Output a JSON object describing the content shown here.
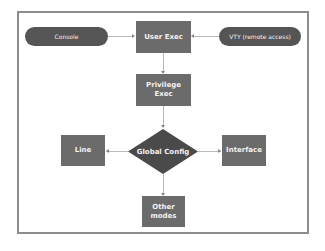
{
  "diagram": {
    "title": "",
    "nodes": {
      "console": {
        "label": "Console",
        "shape": "pill"
      },
      "user_exec": {
        "label": "User Exec",
        "shape": "rectangle"
      },
      "vty": {
        "label": "VTY (remote access)",
        "shape": "pill"
      },
      "privilege_exec": {
        "label": "Privilege Exec",
        "shape": "rectangle"
      },
      "global_config": {
        "label": "Global Config",
        "shape": "diamond"
      },
      "line": {
        "label": "Line",
        "shape": "rectangle"
      },
      "interface": {
        "label": "Interface",
        "shape": "rectangle"
      },
      "other_modes": {
        "label": "Other\nmodes",
        "line1": "Other",
        "line2": "modes",
        "shape": "rectangle"
      }
    },
    "edges": [
      {
        "from": "Console",
        "to": "User Exec"
      },
      {
        "from": "VTY (remote access)",
        "to": "User Exec"
      },
      {
        "from": "User Exec",
        "to": "Privilege Exec"
      },
      {
        "from": "Privilege Exec",
        "to": "Global Config"
      },
      {
        "from": "Global Config",
        "to": "Line"
      },
      {
        "from": "Global Config",
        "to": "Interface"
      },
      {
        "from": "Global Config",
        "to": "Other modes"
      }
    ],
    "colors": {
      "pill": "#555555",
      "box": "#6b6b6b",
      "diamond": "#4a4a4a",
      "connector": "#b8b8b8",
      "frame": "#8c8c8c",
      "text": "#f2f2f2"
    }
  }
}
